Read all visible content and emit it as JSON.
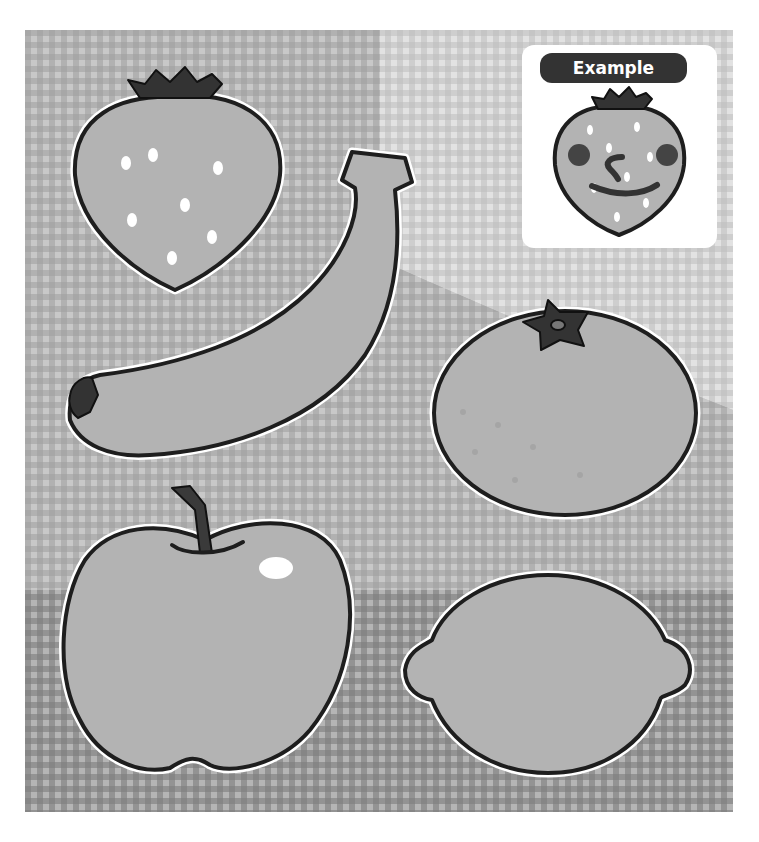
{
  "example": {
    "label": "Example"
  },
  "fruits": [
    {
      "name": "strawberry",
      "outline_only": false
    },
    {
      "name": "banana",
      "outline_only": false
    },
    {
      "name": "orange",
      "outline_only": false
    },
    {
      "name": "apple",
      "outline_only": false
    },
    {
      "name": "lemon",
      "outline_only": false
    }
  ],
  "colors": {
    "fruit_fill": "#b3b3b3",
    "outline": "#1e1e1e",
    "stem": "#3a3a3a",
    "checker_light": "#d9d9d9",
    "checker_dark": "#8f8f8f",
    "label_bg": "#333333",
    "label_text": "#ffffff"
  }
}
